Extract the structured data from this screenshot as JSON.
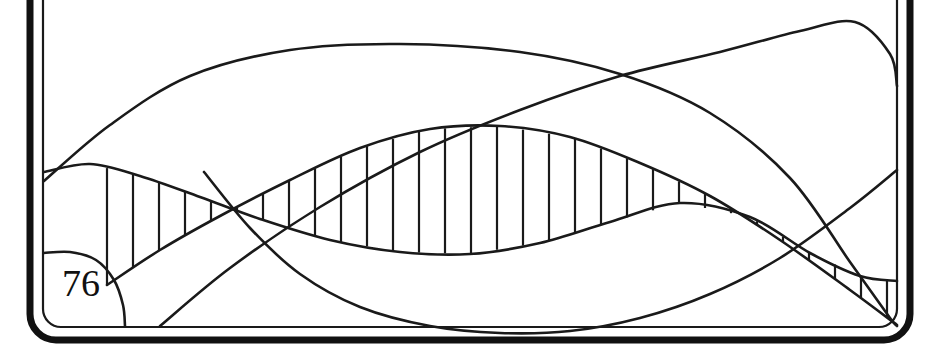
{
  "figure": {
    "number_label": "76",
    "title": "",
    "caption": "",
    "background_color": "#ffffff",
    "ink_color": "#1a1a1a",
    "frame": {
      "style": "rounded-double-rule",
      "outer_stroke_width": 7,
      "inner_stroke_width": 2.2,
      "corner_radius": 26,
      "outer_rect": {
        "x": 30,
        "y": -40,
        "width": 880,
        "height": 380
      },
      "inner_rect": {
        "x": 43,
        "y": -28,
        "width": 854,
        "height": 355
      }
    },
    "label_badge": {
      "text": "76",
      "x": 62,
      "y": 296,
      "font_size": 38,
      "shape": "arc-enclosed-corner"
    }
  },
  "chart_data": {
    "type": "line",
    "title": "",
    "subtitle": "",
    "xlabel": "",
    "ylabel": "",
    "grid": false,
    "legend": "none",
    "annotations": [
      "76"
    ],
    "xlim": [
      0,
      939
    ],
    "ylim": [
      357,
      0
    ],
    "coordinate_note": "Values are given in screenshot pixel coordinates; y increases downward.",
    "series": [
      {
        "name": "upper-envelope",
        "role": "hatch-boundary-top",
        "stroke": "#1a1a1a",
        "points": [
          [
            44,
            172
          ],
          [
            90,
            164
          ],
          [
            140,
            176
          ],
          [
            200,
            197
          ],
          [
            260,
            219
          ],
          [
            330,
            240
          ],
          [
            400,
            252
          ],
          [
            470,
            254
          ],
          [
            540,
            243
          ],
          [
            610,
            222
          ],
          [
            680,
            203
          ],
          [
            750,
            217
          ],
          [
            810,
            253
          ],
          [
            860,
            276
          ],
          [
            897,
            281
          ]
        ]
      },
      {
        "name": "lower-envelope",
        "role": "hatch-boundary-bottom",
        "stroke": "#1a1a1a",
        "points": [
          [
            107,
            285
          ],
          [
            160,
            250
          ],
          [
            220,
            216
          ],
          [
            290,
            180
          ],
          [
            360,
            148
          ],
          [
            430,
            129
          ],
          [
            500,
            126
          ],
          [
            570,
            137
          ],
          [
            640,
            163
          ],
          [
            710,
            196
          ],
          [
            780,
            240
          ],
          [
            850,
            290
          ],
          [
            897,
            325
          ]
        ]
      },
      {
        "name": "broad-arch",
        "role": "free-curve",
        "stroke": "#1a1a1a",
        "points": [
          [
            44,
            181
          ],
          [
            110,
            125
          ],
          [
            190,
            76
          ],
          [
            290,
            50
          ],
          [
            400,
            44
          ],
          [
            520,
            52
          ],
          [
            620,
            74
          ],
          [
            710,
            113
          ],
          [
            790,
            178
          ],
          [
            850,
            262
          ],
          [
            890,
            318
          ],
          [
            897,
            326
          ]
        ]
      },
      {
        "name": "rising-peak",
        "role": "free-curve",
        "stroke": "#1a1a1a",
        "points": [
          [
            160,
            326
          ],
          [
            230,
            268
          ],
          [
            320,
            207
          ],
          [
            420,
            152
          ],
          [
            520,
            110
          ],
          [
            620,
            76
          ],
          [
            720,
            52
          ],
          [
            800,
            31
          ],
          [
            855,
            22
          ],
          [
            890,
            54
          ],
          [
            897,
            86
          ]
        ]
      },
      {
        "name": "basin-curve",
        "role": "free-curve",
        "stroke": "#1a1a1a",
        "points": [
          [
            204,
            172
          ],
          [
            250,
            228
          ],
          [
            300,
            274
          ],
          [
            360,
            307
          ],
          [
            430,
            326
          ],
          [
            500,
            333
          ],
          [
            570,
            331
          ],
          [
            640,
            318
          ],
          [
            710,
            294
          ],
          [
            780,
            258
          ],
          [
            850,
            208
          ],
          [
            897,
            170
          ]
        ]
      },
      {
        "name": "corner-arc",
        "role": "label-enclosure",
        "stroke": "#1a1a1a",
        "points": [
          [
            44,
            253
          ],
          [
            70,
            252
          ],
          [
            96,
            260
          ],
          [
            114,
            280
          ],
          [
            123,
            305
          ],
          [
            125,
            326
          ]
        ]
      }
    ],
    "hatching": {
      "style": "vertical-lines",
      "count": 31,
      "x_start": 107,
      "x_end": 893,
      "spacing": 26,
      "stroke_width": 2.2,
      "between": [
        "upper-envelope",
        "lower-envelope"
      ]
    }
  }
}
